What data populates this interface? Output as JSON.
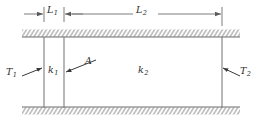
{
  "figure": {
    "line_color": "#7d7d7d",
    "text_color": "#2b2b2b",
    "hatch_color": "#8a8a8a"
  },
  "dimensions": [
    {
      "id": "L1",
      "symbol": "L",
      "subscript": "1",
      "label": "L1"
    },
    {
      "id": "L2",
      "symbol": "L",
      "subscript": "2",
      "label": "L2"
    }
  ],
  "labels": {
    "T1": {
      "symbol": "T",
      "subscript": "1"
    },
    "T2": {
      "symbol": "T",
      "subscript": "2"
    },
    "k1": {
      "symbol": "k",
      "subscript": "1"
    },
    "k2": {
      "symbol": "k",
      "subscript": "2"
    },
    "A": {
      "symbol": "A",
      "subscript": ""
    }
  },
  "geometry": {
    "wall_left_x": 44,
    "wall_mid_x": 64,
    "wall_right_x": 222,
    "top_boundary_y": 37,
    "bottom_boundary_y": 107,
    "hatch_left_x": 22,
    "hatch_right_x": 240,
    "dimension_line_y": 14
  }
}
